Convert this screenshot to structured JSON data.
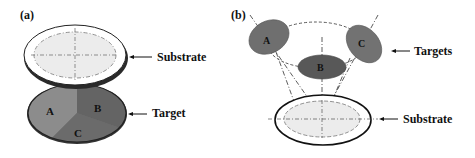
{
  "panel_a": {
    "label": "(a)",
    "substrate_label": "Substrate",
    "target_label": "Target",
    "segments": [
      "A",
      "B",
      "C"
    ]
  },
  "panel_b": {
    "label": "(b)",
    "targets_label": "Targets",
    "substrate_label": "Substrate",
    "targets": [
      "A",
      "B",
      "C"
    ]
  },
  "colors": {
    "target_light": "#8a8a8a",
    "target_mid": "#6e6e6e",
    "target_dark": "#5a5a5a",
    "substrate_fill": "#ececec",
    "outline": "#222222"
  }
}
